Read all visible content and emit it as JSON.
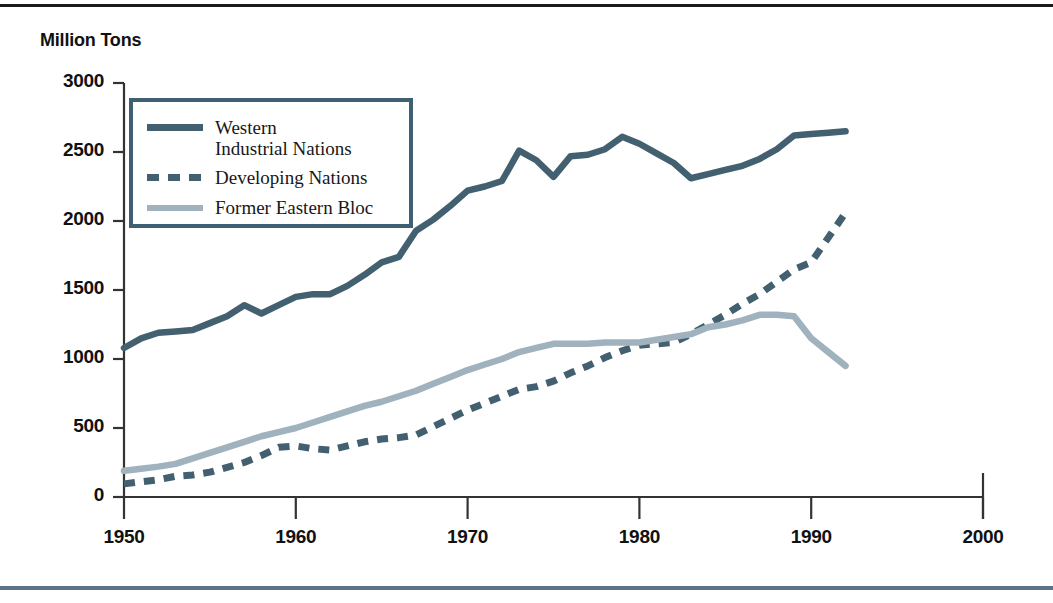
{
  "figure": {
    "axis_title": "Million Tons",
    "colors": {
      "western": "#42606f",
      "developing": "#42606f",
      "eastern_bloc": "#9fb2be",
      "axis": "#333333",
      "legend_border": "#3f5f73",
      "rule_top": "#1a1a1a",
      "rule_bottom": "#5b7386"
    }
  },
  "legend": {
    "entries": [
      {
        "label": "Western\nIndustrial Nations",
        "style": "solid",
        "color_key": "western"
      },
      {
        "label": "Developing Nations",
        "style": "dashed",
        "color_key": "developing"
      },
      {
        "label": "Former Eastern Bloc",
        "style": "solid-light",
        "color_key": "eastern_bloc"
      }
    ]
  },
  "chart_data": {
    "type": "line",
    "title": "",
    "subtitle": "",
    "xlabel": "",
    "ylabel": "Million Tons",
    "xlim": [
      1950,
      2000
    ],
    "ylim": [
      0,
      3000
    ],
    "xticks": [
      1950,
      1960,
      1970,
      1980,
      1990,
      2000
    ],
    "yticks": [
      0,
      500,
      1000,
      1500,
      2000,
      2500,
      3000
    ],
    "grid": false,
    "legend_position": "upper-left-inside",
    "series": [
      {
        "name": "Western Industrial Nations",
        "style": "solid",
        "color": "#42606f",
        "x": [
          1950,
          1951,
          1952,
          1953,
          1954,
          1955,
          1956,
          1957,
          1958,
          1959,
          1960,
          1961,
          1962,
          1963,
          1964,
          1965,
          1966,
          1967,
          1968,
          1969,
          1970,
          1971,
          1972,
          1973,
          1974,
          1975,
          1976,
          1977,
          1978,
          1979,
          1980,
          1981,
          1982,
          1983,
          1984,
          1985,
          1986,
          1987,
          1988,
          1989,
          1990,
          1991,
          1992
        ],
        "values": [
          1080,
          1150,
          1190,
          1200,
          1210,
          1260,
          1310,
          1390,
          1330,
          1390,
          1450,
          1470,
          1470,
          1530,
          1610,
          1700,
          1740,
          1930,
          2010,
          2110,
          2220,
          2250,
          2290,
          2510,
          2440,
          2320,
          2470,
          2480,
          2520,
          2610,
          2560,
          2490,
          2420,
          2310,
          2340,
          2370,
          2400,
          2450,
          2520,
          2620,
          2630,
          2640,
          2650
        ]
      },
      {
        "name": "Developing Nations",
        "style": "dashed",
        "color": "#42606f",
        "x": [
          1950,
          1951,
          1952,
          1953,
          1954,
          1955,
          1956,
          1957,
          1958,
          1959,
          1960,
          1961,
          1962,
          1963,
          1964,
          1965,
          1966,
          1967,
          1968,
          1969,
          1970,
          1971,
          1972,
          1973,
          1974,
          1975,
          1976,
          1977,
          1978,
          1979,
          1980,
          1981,
          1982,
          1983,
          1984,
          1985,
          1986,
          1987,
          1988,
          1989,
          1990,
          1991,
          1992
        ],
        "values": [
          95,
          110,
          125,
          150,
          160,
          180,
          215,
          250,
          300,
          360,
          370,
          350,
          340,
          370,
          400,
          420,
          430,
          450,
          510,
          570,
          630,
          680,
          730,
          780,
          800,
          840,
          900,
          950,
          1010,
          1060,
          1100,
          1110,
          1120,
          1180,
          1250,
          1320,
          1400,
          1470,
          1560,
          1650,
          1700,
          1880,
          2060
        ]
      },
      {
        "name": "Former Eastern Bloc",
        "style": "solid",
        "color": "#9fb2be",
        "x": [
          1950,
          1951,
          1952,
          1953,
          1954,
          1955,
          1956,
          1957,
          1958,
          1959,
          1960,
          1961,
          1962,
          1963,
          1964,
          1965,
          1966,
          1967,
          1968,
          1969,
          1970,
          1971,
          1972,
          1973,
          1974,
          1975,
          1976,
          1977,
          1978,
          1979,
          1980,
          1981,
          1982,
          1983,
          1984,
          1985,
          1986,
          1987,
          1988,
          1989,
          1990,
          1991,
          1992
        ],
        "values": [
          190,
          205,
          220,
          240,
          280,
          320,
          360,
          400,
          440,
          470,
          500,
          540,
          580,
          620,
          660,
          690,
          730,
          770,
          820,
          870,
          920,
          960,
          1000,
          1050,
          1080,
          1110,
          1110,
          1110,
          1120,
          1120,
          1120,
          1140,
          1160,
          1180,
          1230,
          1250,
          1280,
          1320,
          1320,
          1310,
          1150,
          1050,
          950
        ]
      }
    ]
  },
  "axes": {
    "ytick_labels": [
      "3000",
      "2500",
      "2000",
      "1500",
      "1000",
      "500",
      "0"
    ],
    "xtick_labels": [
      "1950",
      "1960",
      "1970",
      "1980",
      "1990",
      "2000"
    ]
  }
}
